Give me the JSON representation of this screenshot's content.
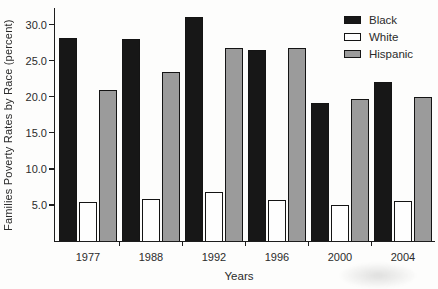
{
  "chart_data": {
    "type": "bar",
    "title": "",
    "xlabel": "Years",
    "ylabel": "Families Poverty Rates by Race (percent)",
    "categories": [
      "1977",
      "1988",
      "1992",
      "1996",
      "2000",
      "2004"
    ],
    "series": [
      {
        "name": "Black",
        "color": "#171717",
        "values": [
          28.2,
          28.0,
          31.0,
          26.5,
          19.2,
          22.0
        ]
      },
      {
        "name": "White",
        "color": "#fefefe",
        "values": [
          5.4,
          5.8,
          6.8,
          5.7,
          5.0,
          5.5
        ]
      },
      {
        "name": "Hispanic",
        "color": "#9b9b9b",
        "values": [
          21.0,
          23.4,
          26.7,
          26.8,
          19.7,
          20.0
        ]
      }
    ],
    "yticks": [
      5.0,
      10.0,
      15.0,
      20.0,
      25.0,
      30.0
    ],
    "ylim": [
      0,
      32.3
    ],
    "grid": false,
    "legend_position": "top-right",
    "legend": [
      "Black",
      "White",
      "Hispanic"
    ]
  }
}
